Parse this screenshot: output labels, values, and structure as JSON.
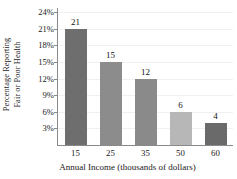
{
  "chart_data": {
    "type": "bar",
    "title": "",
    "categories": [
      "15",
      "25",
      "35",
      "50",
      "60"
    ],
    "values": [
      21,
      15,
      12,
      6,
      4
    ],
    "value_labels": [
      "21",
      "15",
      "12",
      "6",
      "4"
    ],
    "bar_colors": [
      "#6e6e6e",
      "#8c8c8c",
      "#8a8a8a",
      "#b7b7b7",
      "#6a6a6a"
    ],
    "xlabel": "Annual Income (thousands of dollars)",
    "ylabel_line1": "Percentage Reporting",
    "ylabel_line2": "Fair or Poor Health",
    "ylim": [
      0,
      24
    ],
    "ytick_values": [
      24,
      21,
      18,
      15,
      12,
      9,
      6,
      3
    ],
    "ytick_labels": [
      "24%",
      "21%",
      "18%",
      "15%",
      "12%",
      "9%",
      "6%",
      "3%"
    ],
    "grid": true,
    "grid_color": "#f0f0f0",
    "axis_color": "#8a8a8a",
    "legend": "none",
    "background": "#ffffff"
  }
}
